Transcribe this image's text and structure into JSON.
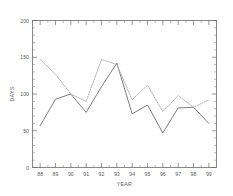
{
  "chart_data": {
    "type": "line",
    "title": "",
    "xlabel": "YEAR",
    "ylabel": "DAYS",
    "categories": [
      "88",
      "89",
      "90",
      "91",
      "92",
      "93",
      "94",
      "95",
      "96",
      "97",
      "98",
      "99"
    ],
    "x": [
      88,
      89,
      90,
      91,
      92,
      93,
      94,
      95,
      96,
      97,
      98,
      99
    ],
    "xlim": [
      87.5,
      99.5
    ],
    "ylim": [
      0,
      200
    ],
    "yticks": [
      0,
      50,
      100,
      150,
      200
    ],
    "ytick_labels": [
      "0",
      "50",
      "100",
      "150",
      "200"
    ],
    "xtick_labels": [
      "88",
      "89",
      "90",
      "91",
      "92",
      "93",
      "94",
      "95",
      "96",
      "97",
      "98",
      "99"
    ],
    "grid": false,
    "legend": "none",
    "series": [
      {
        "name": "solid",
        "style": "solid",
        "color": "#6d6d6d",
        "values": [
          57,
          93,
          100,
          75,
          110,
          142,
          73,
          85,
          47,
          81,
          82,
          60
        ]
      },
      {
        "name": "dotted",
        "style": "dotted",
        "color": "#a9a9a9",
        "values": [
          147,
          127,
          100,
          90,
          147,
          140,
          92,
          112,
          76,
          98,
          82,
          92
        ]
      }
    ]
  },
  "axes": {
    "y_title": "DAYS",
    "x_title": "YEAR"
  }
}
